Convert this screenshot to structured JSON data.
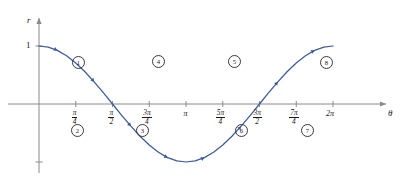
{
  "figure": {
    "curve_color": "#3c5a9a",
    "axis_color": "#8a8a8a",
    "text_color": "#1a1a1a",
    "y_axis_label": "r",
    "x_axis_label": "θ",
    "y_tick_label": "1"
  },
  "x_ticks": [
    {
      "id": "pi-over-4",
      "num": "π",
      "den": "4",
      "x": 0.785398
    },
    {
      "id": "pi-over-2",
      "num": "π",
      "den": "2",
      "x": 1.570796
    },
    {
      "id": "3pi-over-4",
      "num": "3π",
      "den": "4",
      "x": 2.356194
    },
    {
      "id": "pi",
      "plain": "π",
      "x": 3.141593
    },
    {
      "id": "5pi-over-4",
      "num": "5π",
      "den": "4",
      "x": 3.926991
    },
    {
      "id": "3pi-over-2",
      "num": "3π",
      "den": "2",
      "x": 4.712389
    },
    {
      "id": "7pi-over-4",
      "num": "7π",
      "den": "4",
      "x": 5.497787
    },
    {
      "id": "2pi",
      "plain": "2π",
      "x": 6.283185
    }
  ],
  "segment_markers": [
    {
      "label": "①",
      "text": "1",
      "x": 72,
      "y": 56
    },
    {
      "label": "②",
      "text": "2",
      "x": 71,
      "y": 124
    },
    {
      "label": "③",
      "text": "3",
      "x": 136,
      "y": 124
    },
    {
      "label": "④",
      "text": "4",
      "x": 152,
      "y": 55
    },
    {
      "label": "⑤",
      "text": "5",
      "x": 228,
      "y": 55
    },
    {
      "label": "⑥",
      "text": "6",
      "x": 235,
      "y": 124
    },
    {
      "label": "⑦",
      "text": "7",
      "x": 301,
      "y": 124
    },
    {
      "label": "⑧",
      "text": "8",
      "x": 320,
      "y": 56
    }
  ],
  "chart_data": {
    "type": "line",
    "title": "",
    "xlabel": "θ",
    "ylabel": "r",
    "xlim": [
      -0.25,
      6.75
    ],
    "ylim": [
      -1.35,
      1.45
    ],
    "grid": false,
    "legend": null,
    "equation": "r = cos(θ)",
    "xtick_values": [
      0.785398,
      1.570796,
      2.356194,
      3.141593,
      3.926991,
      4.712389,
      5.497787,
      6.283185
    ],
    "xtick_labels": [
      "π/4",
      "π/2",
      "3π/4",
      "π",
      "5π/4",
      "3π/2",
      "7π/4",
      "2π"
    ],
    "ytick_values": [
      1,
      -1
    ],
    "ytick_labels": [
      "1",
      ""
    ],
    "series": [
      {
        "name": "r = cos(theta)",
        "color": "#3c5a9a",
        "x": [
          0.0,
          0.1963,
          0.3927,
          0.589,
          0.7854,
          0.9817,
          1.1781,
          1.3744,
          1.5708,
          1.7671,
          1.9635,
          2.1598,
          2.3562,
          2.5525,
          2.7489,
          2.9452,
          3.1416,
          3.3379,
          3.5343,
          3.7306,
          3.927,
          4.1233,
          4.3197,
          4.516,
          4.7124,
          4.9087,
          5.1051,
          5.3014,
          5.4978,
          5.6941,
          5.8905,
          6.0868,
          6.2832
        ],
        "y": [
          1.0,
          0.9808,
          0.9239,
          0.8315,
          0.7071,
          0.5556,
          0.3827,
          0.1951,
          0.0,
          -0.1951,
          -0.3827,
          -0.5556,
          -0.7071,
          -0.8315,
          -0.9239,
          -0.9808,
          -1.0,
          -0.9808,
          -0.9239,
          -0.8315,
          -0.7071,
          -0.5556,
          -0.3827,
          -0.1951,
          0.0,
          0.1951,
          0.3827,
          0.5556,
          0.7071,
          0.8315,
          0.9239,
          0.9808,
          1.0
        ]
      }
    ],
    "annotations": [
      {
        "label": "1",
        "theta_range": [
          0.0,
          0.785
        ],
        "position": "above-axis"
      },
      {
        "label": "2",
        "theta_range": [
          0.785,
          1.571
        ],
        "position": "below-axis"
      },
      {
        "label": "3",
        "theta_range": [
          1.571,
          2.356
        ],
        "position": "below-axis"
      },
      {
        "label": "4",
        "theta_range": [
          2.356,
          3.142
        ],
        "position": "above-axis"
      },
      {
        "label": "5",
        "theta_range": [
          3.142,
          3.927
        ],
        "position": "above-axis"
      },
      {
        "label": "6",
        "theta_range": [
          3.927,
          4.712
        ],
        "position": "below-axis"
      },
      {
        "label": "7",
        "theta_range": [
          4.712,
          5.498
        ],
        "position": "below-axis"
      },
      {
        "label": "8",
        "theta_range": [
          5.498,
          6.283
        ],
        "position": "above-axis"
      }
    ]
  }
}
